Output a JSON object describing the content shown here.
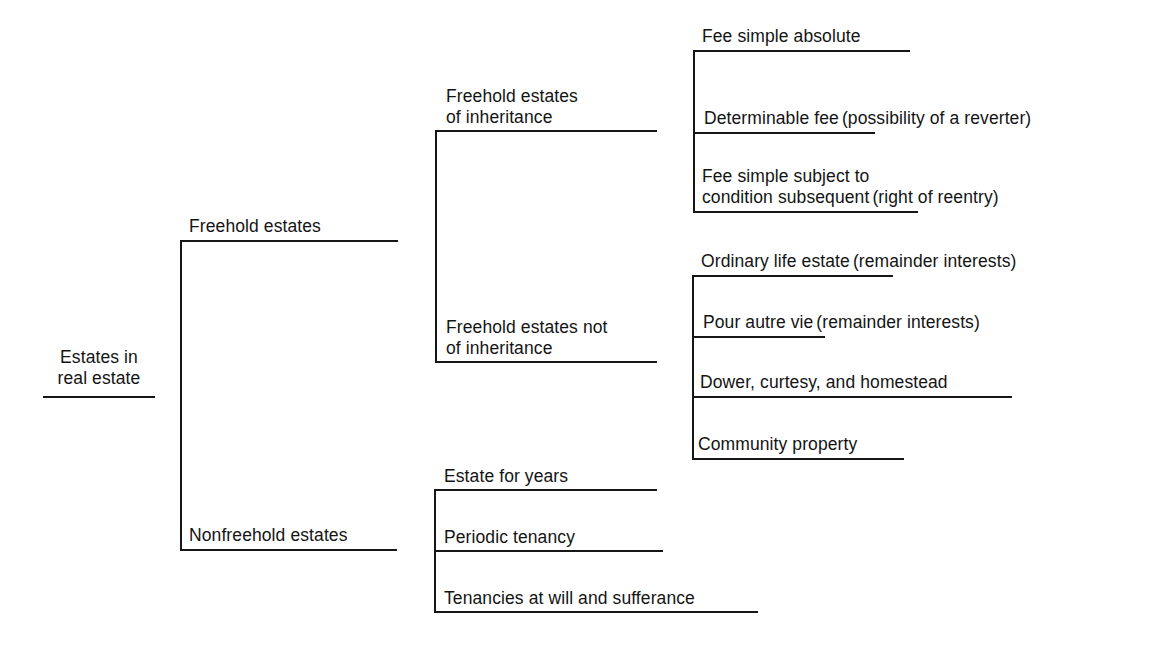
{
  "diagram": {
    "title": "Estates in real estate",
    "root": {
      "line1": "Estates in",
      "line2": "real estate"
    },
    "level1": [
      {
        "id": "freehold",
        "label": "Freehold estates"
      },
      {
        "id": "nonfreehold",
        "label": "Nonfreehold estates"
      }
    ],
    "freehold_children": [
      {
        "id": "fei",
        "line1": "Freehold estates",
        "line2": "of inheritance"
      },
      {
        "id": "feni",
        "line1": "Freehold estates not",
        "line2": "of inheritance"
      }
    ],
    "inheritance_children": [
      {
        "id": "fsa",
        "main": "Fee simple absolute",
        "note": ""
      },
      {
        "id": "df",
        "main": "Determinable fee",
        "note": "(possibility of a reverter)"
      },
      {
        "id": "fsscs",
        "main_line1": "Fee simple subject to",
        "main_line2": "condition subsequent",
        "note": "(right of reentry)"
      }
    ],
    "non_inheritance_children": [
      {
        "id": "ole",
        "main": "Ordinary life estate",
        "note": "(remainder interests)"
      },
      {
        "id": "pav",
        "main": "Pour autre vie",
        "note": "(remainder interests)"
      },
      {
        "id": "dch",
        "main": "Dower, curtesy, and homestead",
        "note": ""
      },
      {
        "id": "cp",
        "main": "Community property",
        "note": ""
      }
    ],
    "nonfreehold_children": [
      {
        "id": "efy",
        "label": "Estate for years"
      },
      {
        "id": "pt",
        "label": "Periodic tenancy"
      },
      {
        "id": "taws",
        "label": "Tenancies at will and sufferance"
      }
    ],
    "line_color": "#161616",
    "text_color": "#141414",
    "background": "#ffffff"
  }
}
